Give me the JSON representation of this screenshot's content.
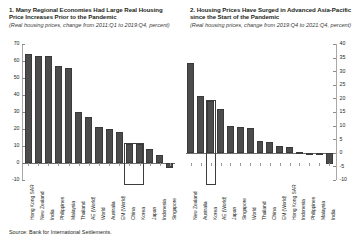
{
  "source_note": "Source: Bank for International Settlements.",
  "chart_data": [
    {
      "type": "bar",
      "panel": "1",
      "title": "1. Many Regional Economies Had Large Real Housing Price Increases Prior to the Pandemic",
      "subtitle": "(Real housing prices, change from 2011:Q1 to 2019:Q4, percent)",
      "xlabel": "",
      "ylabel": "",
      "ylim": [
        -10,
        70
      ],
      "yticks": [
        70,
        60,
        50,
        40,
        30,
        20,
        10,
        0,
        -10
      ],
      "ytick_labels": [
        "70",
        "60",
        "50",
        "40",
        "30",
        "20",
        "10",
        "0",
        "-10"
      ],
      "axis_position": "left",
      "grid": false,
      "legend": "none",
      "categories": [
        "Hong Kong SAR",
        "New Zealand",
        "India",
        "Philippines",
        "Malaysia",
        "Thailand",
        "AE (World)",
        "World",
        "Australia",
        "EM (World)",
        "China",
        "Korea",
        "Japan",
        "Indonesia",
        "Singapore"
      ],
      "values": [
        64,
        63,
        63,
        57,
        56,
        30,
        27,
        21,
        20,
        18,
        11,
        11,
        8,
        5,
        -3
      ],
      "highlight": {
        "categories": [
          "China",
          "Korea"
        ],
        "style": "box-outline"
      },
      "bar_color": "#4c4c4c"
    },
    {
      "type": "bar",
      "panel": "2",
      "title": "2. Housing Prices Have Surged in Advanced Asia-Pacific since the Start of the Pandemic",
      "subtitle": "(Real housing prices, change from 2019:Q4 to 2021:Q4, percent)",
      "xlabel": "",
      "ylabel": "",
      "ylim": [
        -10,
        40
      ],
      "yticks": [
        40,
        35,
        30,
        25,
        20,
        15,
        10,
        5,
        0,
        -5,
        -10
      ],
      "ytick_labels": [
        "40",
        "35",
        "30",
        "25",
        "20",
        "15",
        "10",
        "5",
        "0",
        "-5",
        "-10"
      ],
      "axis_position": "right",
      "grid": false,
      "legend": "none",
      "categories": [
        "New Zealand",
        "Australia",
        "Korea",
        "AE (World)",
        "Japan",
        "Singapore",
        "World",
        "Thailand",
        "China",
        "EM (World)",
        "Hong Kong SAR",
        "Indonesia",
        "Philippines",
        "Malaysia",
        "India"
      ],
      "values": [
        33,
        21,
        19,
        16,
        10,
        9.5,
        9,
        4.5,
        4,
        2.5,
        2,
        0.2,
        -0.5,
        -0.8,
        -4
      ],
      "highlight": {
        "categories": [
          "Korea"
        ],
        "style": "box-outline"
      },
      "bar_color": "#4c4c4c"
    }
  ]
}
